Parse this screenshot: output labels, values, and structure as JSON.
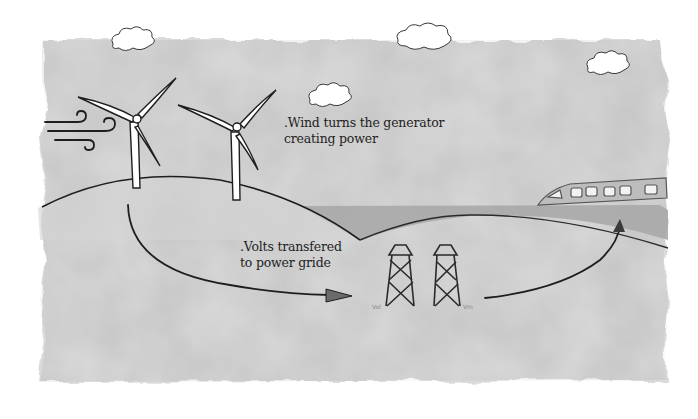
{
  "diagram": {
    "title": "",
    "annotations": {
      "wind": {
        "line1": ".Wind turns the generator",
        "line2": "creating power"
      },
      "volts": {
        "line1": ".Volts transfered",
        "line2": "to power gride"
      },
      "tower_left_scribble": "Vol",
      "tower_right_scribble": "Vm"
    },
    "elements": [
      {
        "name": "wind-gust",
        "type": "wind-swirls",
        "count": 3
      },
      {
        "name": "wind-turbine",
        "count": 2
      },
      {
        "name": "power-transmission-tower",
        "count": 2
      },
      {
        "name": "train",
        "windows": 6
      },
      {
        "name": "cloud",
        "count": 4
      },
      {
        "name": "flow-arrow",
        "from": "turbines",
        "to": "power-towers"
      },
      {
        "name": "flow-arrow",
        "from": "power-towers",
        "to": "train"
      }
    ],
    "colors": {
      "paper": "#ffffff",
      "wash": "#d9d9d9",
      "hill": "#cfcfcf",
      "road": "#9e9e9e",
      "ink": "#1e1e1e"
    }
  }
}
